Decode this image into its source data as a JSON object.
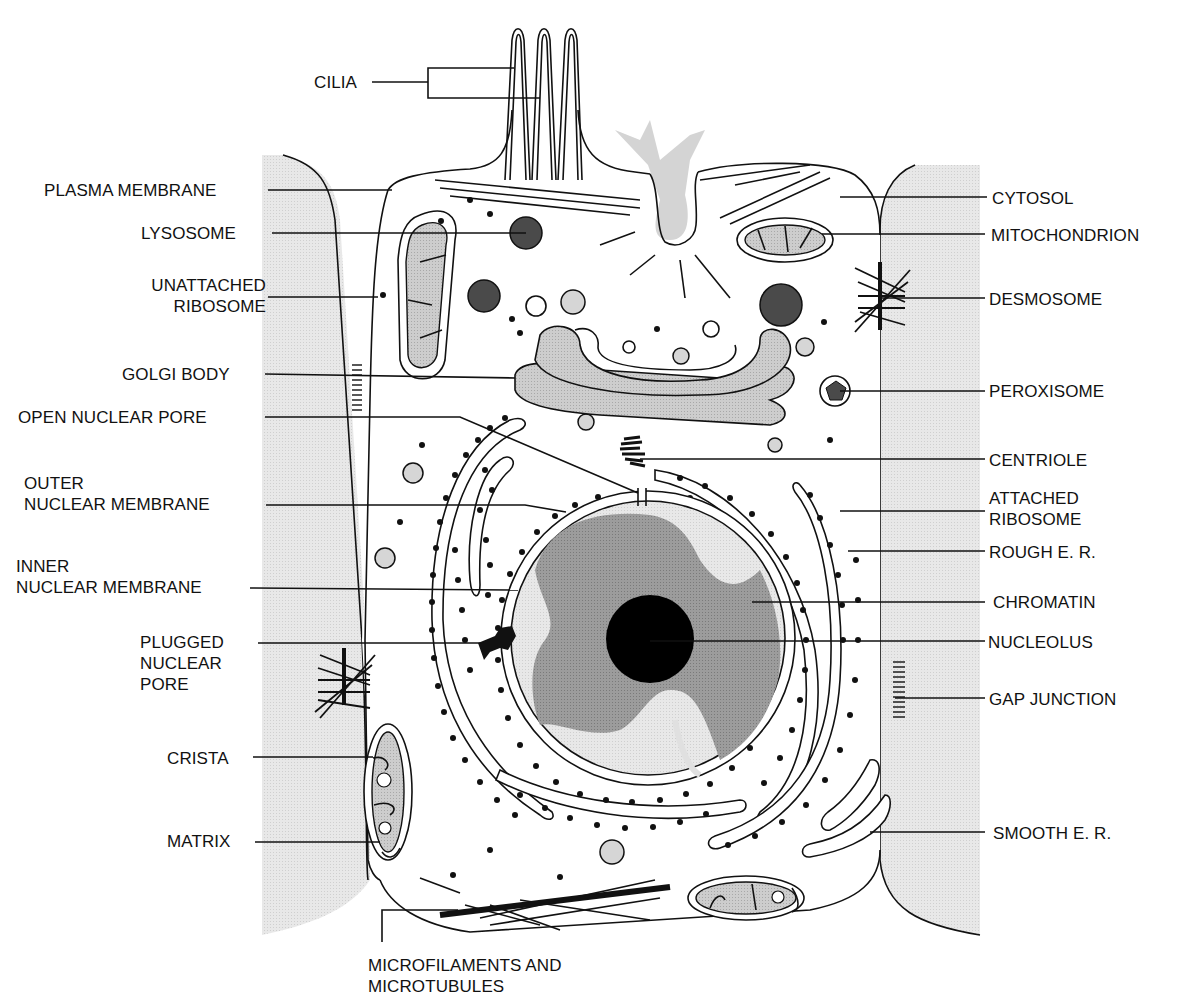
{
  "diagram": {
    "colors": {
      "neighbor_cell": "#e6e6e6",
      "organelle_fill": "#cfcfcf",
      "dark_vesicle": "#4a4a4a",
      "chromatin_dark": "#9a9a9a",
      "nucleoplasm_light": "#d6d6d6",
      "nucleolus": "#000000",
      "line": "#111111"
    },
    "labels_left": [
      {
        "id": "cilia",
        "text": "CILIA"
      },
      {
        "id": "plasma-membrane",
        "text": "PLASMA  MEMBRANE"
      },
      {
        "id": "lysosome",
        "text": "LYSOSOME"
      },
      {
        "id": "unattached-ribosome",
        "text": "UNATTACHED\nRIBOSOME",
        "line1": "UNATTACHED",
        "line2": "RIBOSOME"
      },
      {
        "id": "golgi-body",
        "text": "GOLGI BODY"
      },
      {
        "id": "open-nuclear-pore",
        "text": "OPEN NUCLEAR PORE"
      },
      {
        "id": "outer-nuclear-membrane",
        "line1": "OUTER",
        "line2": "NUCLEAR MEMBRANE"
      },
      {
        "id": "inner-nuclear-membrane",
        "line1": "INNER",
        "line2": "NUCLEAR MEMBRANE"
      },
      {
        "id": "plugged-nuclear-pore",
        "line1": "PLUGGED",
        "line2": "NUCLEAR",
        "line3": "PORE"
      },
      {
        "id": "crista",
        "text": "CRISTA"
      },
      {
        "id": "matrix",
        "text": "MATRIX"
      }
    ],
    "labels_right": [
      {
        "id": "cytosol",
        "text": "CYTOSOL"
      },
      {
        "id": "mitochondrion",
        "text": "MITOCHONDRION"
      },
      {
        "id": "desmosome",
        "text": "DESMOSOME"
      },
      {
        "id": "peroxisome",
        "text": "PEROXISOME"
      },
      {
        "id": "centriole",
        "text": "CENTRIOLE"
      },
      {
        "id": "attached-ribosome",
        "line1": "ATTACHED",
        "line2": "RIBOSOME"
      },
      {
        "id": "rough-er",
        "text": "ROUGH  E. R."
      },
      {
        "id": "chromatin",
        "text": "CHROMATIN"
      },
      {
        "id": "nucleolus",
        "text": "NUCLEOLUS"
      },
      {
        "id": "gap-junction",
        "text": "GAP JUNCTION"
      },
      {
        "id": "smooth-er",
        "text": "SMOOTH  E. R."
      }
    ],
    "labels_bottom": [
      {
        "id": "microfilaments",
        "line1": "MICROFILAMENTS  AND",
        "line2": "MICROTUBULES"
      }
    ]
  }
}
